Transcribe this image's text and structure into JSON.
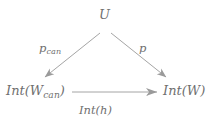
{
  "diagram": {
    "type": "commutative-triangle",
    "background_color": "#ffffff",
    "stroke_color": "#9a9a9a",
    "text_color": "#6f6f6f",
    "nodes": [
      {
        "id": "u",
        "label": "U",
        "x": 105,
        "y": 26
      },
      {
        "id": "int_wcan",
        "label": "Int(W",
        "sub": "can",
        "label_close": ")",
        "x": 38,
        "y": 92
      },
      {
        "id": "int_w",
        "label": "Int(W)",
        "x": 180,
        "y": 92
      }
    ],
    "edges": [
      {
        "id": "u-to-int-wcan",
        "from": "u",
        "to": "int_wcan",
        "label": "p",
        "label_sub": "can"
      },
      {
        "id": "u-to-int-w",
        "from": "u",
        "to": "int_w",
        "label": "p"
      },
      {
        "id": "int-wcan-to-int-w",
        "from": "int_wcan",
        "to": "int_w",
        "label": "Int(h)"
      }
    ],
    "node_labels": {
      "apex": "U",
      "bottom_left_prefix": "Int(W",
      "bottom_left_subscript": "can",
      "bottom_left_suffix": ")",
      "bottom_right": "Int(W)"
    },
    "edge_labels": {
      "left_prefix": "p",
      "left_subscript": "can",
      "right": "p",
      "bottom": "Int(h)"
    }
  }
}
